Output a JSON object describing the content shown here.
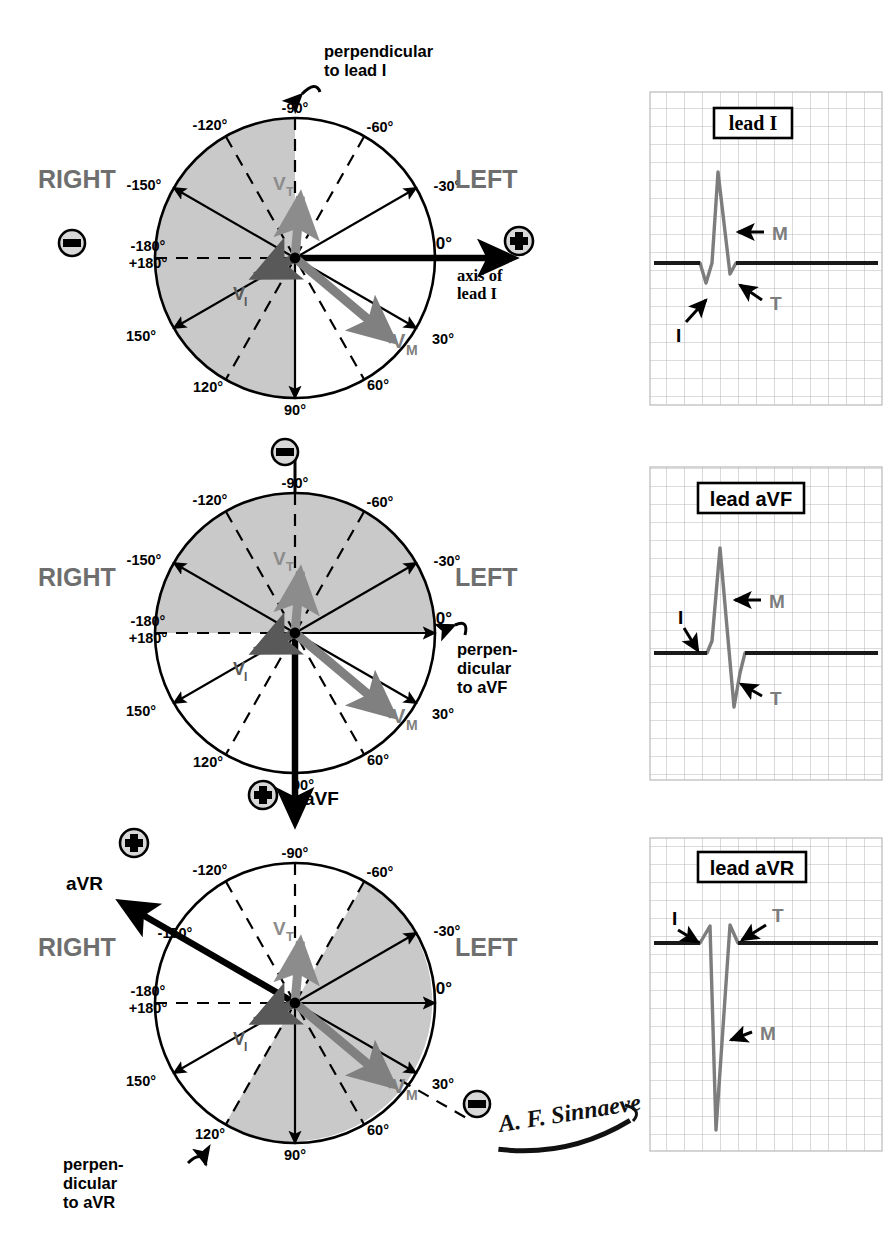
{
  "figure": {
    "signature": "A. F. Sinnaeve",
    "colors": {
      "shade": "#c9c9c9",
      "vector_mean": "#808080",
      "vector_terminal": "#8c8c8c",
      "vector_initial": "#595959",
      "grid": "#b9b9b9",
      "trace": "#7d7d7d",
      "baseline": "#1a1a1a",
      "ink": "#000000",
      "side_label": "#6e6e6e"
    }
  },
  "common": {
    "right_label": "RIGHT",
    "left_label": "LEFT",
    "plus_symbol": "+",
    "minus_symbol": "-",
    "degree_labels": [
      "-90°",
      "-60°",
      "-30°",
      "0°",
      "30°",
      "60°",
      "90°",
      "120°",
      "150°",
      "-180°",
      "+180°",
      "-150°",
      "-120°"
    ],
    "vectors": [
      {
        "id": "VT",
        "label": "V",
        "subscript": "T",
        "angle_deg": -85,
        "length": 62,
        "color": "#8c8c8c"
      },
      {
        "id": "VI",
        "label": "V",
        "subscript": "I",
        "angle_deg": 205,
        "length": 44,
        "color": "#595959"
      },
      {
        "id": "VM",
        "label": "V",
        "subscript": "M",
        "angle_deg": 40,
        "length": 128,
        "color": "#808080"
      }
    ]
  },
  "diagrams": [
    {
      "id": "lead-I",
      "name": "lead I axis diagram",
      "center": {
        "x": 295,
        "y": 258
      },
      "radius": 140,
      "shaded_sector": {
        "from_deg": 90,
        "to_deg": 270,
        "note": "negative half for lead I (right side)"
      },
      "axis_arrow": {
        "angle_deg": 0,
        "label": "axis of lead I",
        "polarity": "+",
        "extends_beyond": true
      },
      "perpendicular": {
        "text_line1": "perpendicular",
        "text_line2": "to lead I",
        "angle_deg": -90
      },
      "polarity_markers": [
        {
          "sign": "-",
          "position": "left",
          "x": 72,
          "y": 243
        },
        {
          "sign": "+",
          "position": "right",
          "x": 519,
          "y": 241
        }
      ],
      "labels": {
        "right": {
          "text": "RIGHT",
          "x": 38,
          "y": 180
        },
        "left": {
          "text": "LEFT",
          "x": 455,
          "y": 180
        }
      }
    },
    {
      "id": "lead-aVF",
      "name": "lead aVF axis diagram",
      "center": {
        "x": 295,
        "y": 633
      },
      "radius": 140,
      "shaded_sector": {
        "from_deg": 180,
        "to_deg": 360,
        "note": "negative half for aVF (upper half)"
      },
      "axis_arrow": {
        "angle_deg": 90,
        "label": "aVF",
        "polarity": "+",
        "extends_beyond": true
      },
      "perpendicular": {
        "text_line1": "perpen-",
        "text_line2": "dicular",
        "text_line3": "to aVF",
        "angle_deg": 0
      },
      "polarity_markers": [
        {
          "sign": "-",
          "position": "top",
          "x": 285,
          "y": 443
        },
        {
          "sign": "+",
          "position": "bottom",
          "x": 271,
          "y": 795
        }
      ],
      "labels": {
        "right": {
          "text": "RIGHT",
          "x": 38,
          "y": 578
        },
        "left": {
          "text": "LEFT",
          "x": 455,
          "y": 578
        }
      }
    },
    {
      "id": "lead-aVR",
      "name": "lead aVR axis diagram",
      "center": {
        "x": 295,
        "y": 1003
      },
      "radius": 140,
      "shaded_sector": {
        "from_deg": -60,
        "to_deg": 120,
        "note": "negative half for aVR"
      },
      "axis_arrow": {
        "angle_deg": -150,
        "label": "aVR",
        "polarity": "+",
        "extends_beyond": true
      },
      "perpendicular": {
        "text_line1": "perpen-",
        "text_line2": "dicular",
        "text_line3": "to aVR",
        "angle_deg": 120
      },
      "polarity_markers": [
        {
          "sign": "+",
          "position": "upper-left",
          "x": 131,
          "y": 843
        },
        {
          "sign": "-",
          "position": "lower-right",
          "x": 477,
          "y": 1104
        }
      ],
      "labels": {
        "right": {
          "text": "RIGHT",
          "x": 38,
          "y": 948
        },
        "left": {
          "text": "LEFT",
          "x": 455,
          "y": 948
        }
      }
    }
  ],
  "ecg_panels": [
    {
      "id": "trace-lead-I",
      "title": "lead I",
      "box": {
        "x": 650,
        "y": 92,
        "w": 232,
        "h": 313
      },
      "grid_cell_px": 18,
      "baseline_y_frac": 0.545,
      "annotations": [
        {
          "label": "I",
          "target": "initial small negative deflection"
        },
        {
          "label": "M",
          "target": "tall positive R wave"
        },
        {
          "label": "T",
          "target": "terminal small negative deflection"
        }
      ],
      "waveform_note": "small negative I, tall positive M, small negative T"
    },
    {
      "id": "trace-lead-aVF",
      "title": "lead aVF",
      "box": {
        "x": 650,
        "y": 467,
        "w": 232,
        "h": 313
      },
      "grid_cell_px": 18,
      "baseline_y_frac": 0.545,
      "annotations": [
        {
          "label": "I",
          "target": "initial small positive deflection"
        },
        {
          "label": "M",
          "target": "tall positive R wave"
        },
        {
          "label": "T",
          "target": "deep terminal negative deflection"
        }
      ],
      "waveform_note": "small positive I, tall positive M, deep negative T"
    },
    {
      "id": "trace-lead-aVR",
      "title": "lead aVR",
      "box": {
        "x": 650,
        "y": 838,
        "w": 232,
        "h": 313
      },
      "grid_cell_px": 18,
      "baseline_y_frac": 0.33,
      "annotations": [
        {
          "label": "I",
          "target": "initial small positive deflection"
        },
        {
          "label": "M",
          "target": "deep negative S wave"
        },
        {
          "label": "T",
          "target": "terminal positive deflection"
        }
      ],
      "waveform_note": "small positive I, deep negative M, positive T"
    }
  ]
}
